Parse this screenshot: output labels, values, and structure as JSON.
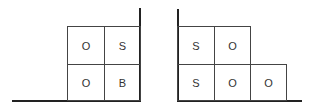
{
  "left_diagram": {
    "cells": [
      {
        "label": "O",
        "row": 0,
        "col": 0
      },
      {
        "label": "S",
        "row": 0,
        "col": 1
      },
      {
        "label": "O",
        "row": 1,
        "col": 0
      },
      {
        "label": "B",
        "row": 1,
        "col": 1
      }
    ]
  },
  "right_diagram": {
    "cells": [
      {
        "label": "S",
        "row": 0,
        "col": 0
      },
      {
        "label": "O",
        "row": 0,
        "col": 1
      },
      {
        "label": "S",
        "row": 1,
        "col": 0
      },
      {
        "label": "O",
        "row": 1,
        "col": 1
      },
      {
        "label": "O",
        "row": 1,
        "col": 2
      }
    ]
  }
}
